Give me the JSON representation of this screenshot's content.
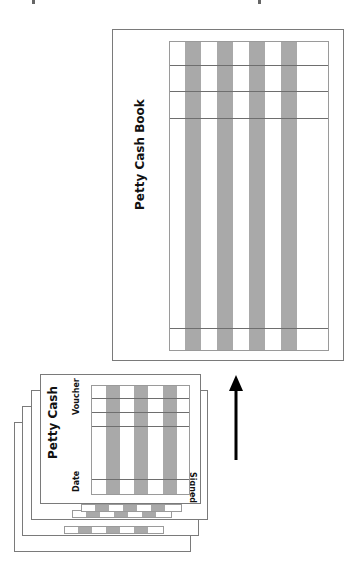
{
  "book": {
    "title": "Petty Cash Book"
  },
  "voucher": {
    "title": "Petty Cash",
    "label_voucher": "Voucher",
    "label_date": "Date",
    "label_signed": "Signed"
  },
  "arrow": {
    "direction": "up",
    "meaning": "vouchers recorded into petty cash book"
  },
  "colors": {
    "shaded_column": "#a9a9a9",
    "border": "#7a7a7a",
    "arrow": "#000000"
  }
}
